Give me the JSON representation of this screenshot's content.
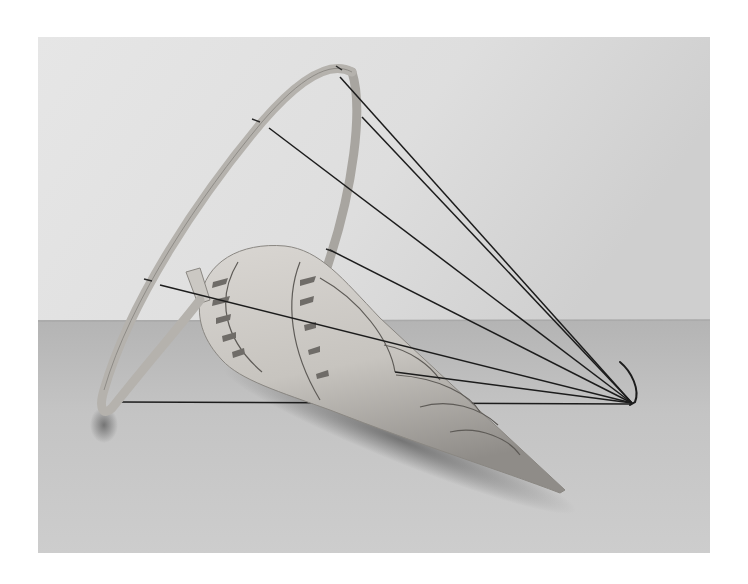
{
  "image": {
    "kind": "photograph",
    "subject": "Sculpture: spiral laminated-wood cone lying on floor, held by a tilted wooden hoop and taut black wires converging to a floor anchor",
    "colors": {
      "page_background": "#ffffff",
      "wall": "#dcdcdc",
      "floor": "#bdbdbd",
      "wood_light": "#d6d3cf",
      "wood_mid": "#b9b6b1",
      "wood_dark": "#8e8b86",
      "wire": "#1c1c1c",
      "shadow": "#6e6e6e"
    },
    "frame": {
      "x": 38,
      "y": 37,
      "width": 672,
      "height": 516
    },
    "horizon_y": 322
  }
}
